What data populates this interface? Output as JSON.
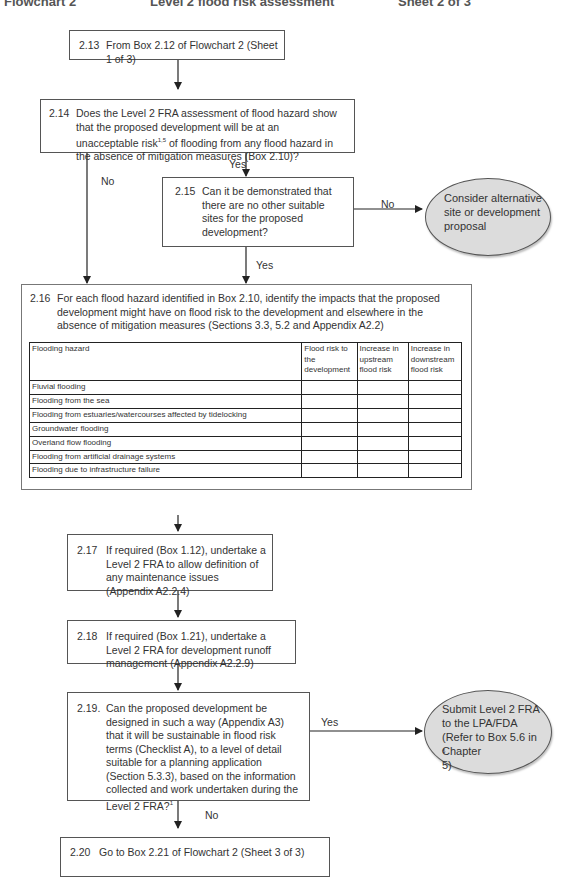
{
  "header": {
    "left": "Flowchart 2",
    "center": "Level 2 flood risk assessment",
    "right": "Sheet 2 of 3"
  },
  "boxes": {
    "b213": {
      "num": "2.13",
      "text": "From Box 2.12 of Flowchart 2 (Sheet 1 of 3)"
    },
    "b214": {
      "num": "2.14",
      "text_before": "Does the Level 2 FRA assessment of flood hazard show that the proposed development will be at an unacceptable risk",
      "sup": "1,5",
      "text_after": " of flooding from any flood hazard in the absence of mitigation measures (Box 2.10)?"
    },
    "b215": {
      "num": "2.15",
      "text": "Can it be demonstrated that there are no other suitable sites for the proposed development?"
    },
    "b216": {
      "num": "2.16",
      "text": "For each flood hazard identified in Box 2.10, identify the impacts that the proposed development might have on flood risk to the development and elsewhere in the absence of mitigation measures (Sections 3.3, 5.2 and Appendix A2.2)"
    },
    "b217": {
      "num": "2.17",
      "text": "If required (Box 1.12), undertake a Level 2 FRA to allow definition of any maintenance issues (Appendix A2.2.4)"
    },
    "b218": {
      "num": "2.18",
      "text": "If required (Box 1.21), undertake a Level 2 FRA for development runoff management (Appendix A2.2.9)"
    },
    "b219": {
      "num": "2.19.",
      "text_before": "Can the proposed development be designed in such a way (Appendix A3) that it will be sustainable in flood risk terms (Checklist A), to a level of detail suitable for a planning application (Section 5.3.3), based on the information collected and work undertaken during the Level 2 FRA?",
      "sup": "1"
    },
    "b220": {
      "num": "2.20",
      "text": "Go to Box 2.21 of Flowchart 2 (Sheet 3 of 3)"
    }
  },
  "terminals": {
    "alt": {
      "lines": [
        "Consider alternative",
        "site or development",
        "proposal"
      ]
    },
    "submit": {
      "lines": [
        "Submit Level 2 FRA",
        "to the LPA/FDA",
        "(Refer to Box 5.6 in",
        "Chapter 5)"
      ],
      "sup": "6"
    }
  },
  "labels": {
    "yes_214": "Yes",
    "no_214": "No",
    "no_215": "No",
    "yes_215": "Yes",
    "yes_219": "Yes",
    "no_219": "No"
  },
  "table": {
    "headers": [
      "Flooding hazard",
      "Flood risk to the development",
      "Increase in upstream flood risk",
      "Increase in downstream flood risk"
    ],
    "rows": [
      "Fluvial flooding",
      "Flooding from the sea",
      "Flooding from estuaries/watercourses affected by tidelocking",
      "Groundwater flooding",
      "Overland flow flooding",
      "Flooding from artificial drainage systems",
      "Flooding due to infrastructure failure"
    ]
  }
}
